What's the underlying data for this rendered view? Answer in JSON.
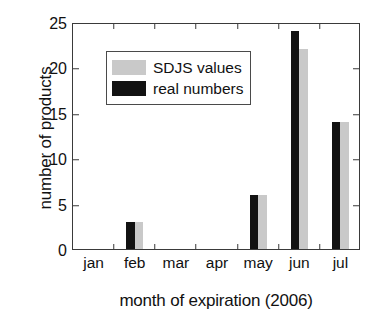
{
  "chart_data": {
    "type": "bar",
    "title": "",
    "xlabel": "month of expiration (2006)",
    "ylabel": "number of products",
    "categories": [
      "jan",
      "feb",
      "mar",
      "apr",
      "may",
      "jun",
      "jul"
    ],
    "series": [
      {
        "name": "real numbers",
        "color": "#121212",
        "values": [
          0,
          3,
          0,
          0,
          6,
          24,
          14
        ]
      },
      {
        "name": "SDJS values",
        "color": "#c9c9c9",
        "values": [
          0,
          3,
          0,
          0,
          6,
          22,
          14
        ]
      }
    ],
    "ylim": [
      0,
      25
    ],
    "yticks": [
      0,
      5,
      10,
      15,
      20,
      25
    ],
    "ytick_labels": [
      "0",
      "5",
      "10",
      "15",
      "20",
      "25"
    ],
    "grid": false,
    "legend": {
      "position": "upper-left-inside",
      "entries": [
        {
          "label": "SDJS values",
          "color": "#c9c9c9"
        },
        {
          "label": "real numbers",
          "color": "#121212"
        }
      ]
    }
  }
}
